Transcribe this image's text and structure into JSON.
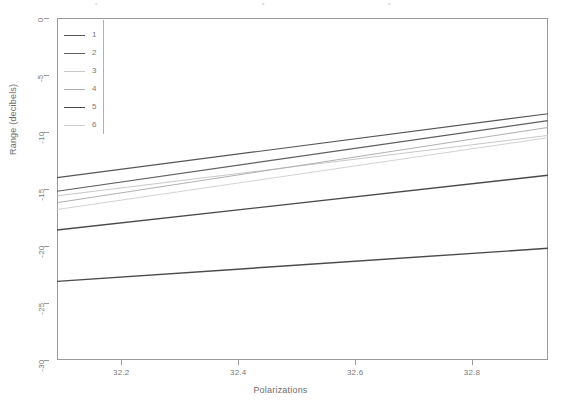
{
  "chart_data": {
    "type": "line",
    "title": "",
    "xlabel": "Polarizations",
    "ylabel": "Range (decibels)",
    "xlim": [
      32.09,
      32.93
    ],
    "ylim": [
      -30,
      0
    ],
    "xticks": [
      32.2,
      32.4,
      32.6,
      32.8
    ],
    "yticks": [
      0,
      -5,
      -10,
      -15,
      -20,
      -25,
      -30
    ],
    "xtick_labels": [
      "32.2",
      "32.4",
      "32.6",
      "32.8"
    ],
    "ytick_labels": [
      "0",
      "-5",
      "-10",
      "-15",
      "-20",
      "-25",
      "-30"
    ],
    "grid": false,
    "legend_position": "upper left",
    "legend_title": "",
    "x": [
      32.09,
      32.93
    ],
    "series": [
      {
        "name": "1",
        "label": "1",
        "color": "#555555",
        "width": 1.2,
        "values": [
          -14.0,
          -8.4
        ]
      },
      {
        "name": "2",
        "label": "2",
        "color": "#5f5f5f",
        "width": 1.2,
        "values": [
          -15.2,
          -9.0
        ]
      },
      {
        "name": "3",
        "label": "3",
        "color": "#c8c8c8",
        "width": 1.0,
        "values": [
          -15.6,
          -10.3
        ]
      },
      {
        "name": "4",
        "label": "4",
        "color": "#b0b0b0",
        "width": 1.0,
        "values": [
          -16.2,
          -9.6
        ]
      },
      {
        "name": "5",
        "label": "5",
        "color": "#4a4a4a",
        "width": 1.4,
        "values": [
          -18.6,
          -13.8
        ]
      },
      {
        "name": "6",
        "label": "6",
        "color": "#d2d2d2",
        "width": 1.0,
        "values": [
          -16.8,
          -10.5
        ]
      }
    ],
    "extra_series": [
      {
        "name": "dark-lower-line",
        "label": "",
        "color": "#4a4a4a",
        "width": 1.4,
        "values": [
          -23.1,
          -20.2
        ]
      }
    ]
  },
  "axes": {
    "y_title": "Range (decibels)",
    "x_title": "Polarizations"
  },
  "legend": {
    "entries": [
      {
        "label": "1"
      },
      {
        "label": "2"
      },
      {
        "label": "3"
      },
      {
        "label": "4"
      },
      {
        "label": "5"
      },
      {
        "label": "6"
      }
    ]
  },
  "top_artifact": {
    "marks": [
      "•",
      "•",
      "•"
    ]
  }
}
